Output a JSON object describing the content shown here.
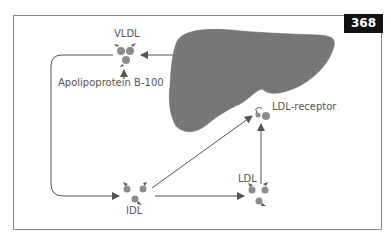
{
  "figure": {
    "number": "368",
    "colors": {
      "liver": "#7a7a7a",
      "particle": "#8c8c8c",
      "arrow": "#555555",
      "frame": "#8a8a8a",
      "badge_bg": "#111111",
      "badge_text": "#ffffff"
    }
  },
  "labels": {
    "vldl": "VLDL",
    "apolipoprotein": "Apolipoprotein B-100",
    "ldl_receptor": "LDL-receptor",
    "idl": "IDL",
    "ldl": "LDL"
  },
  "nodes": [
    {
      "id": "liver",
      "label": ""
    },
    {
      "id": "vldl",
      "label": "VLDL"
    },
    {
      "id": "idl",
      "label": "IDL"
    },
    {
      "id": "ldl",
      "label": "LDL"
    },
    {
      "id": "ldl-receptor",
      "label": "LDL-receptor"
    },
    {
      "id": "apob100",
      "label": "Apolipoprotein B-100"
    }
  ],
  "edges": [
    {
      "from": "liver",
      "to": "vldl"
    },
    {
      "from": "apob100",
      "to": "vldl"
    },
    {
      "from": "vldl",
      "to": "idl"
    },
    {
      "from": "idl",
      "to": "ldl"
    },
    {
      "from": "idl",
      "to": "ldl-receptor"
    },
    {
      "from": "ldl",
      "to": "ldl-receptor"
    }
  ]
}
